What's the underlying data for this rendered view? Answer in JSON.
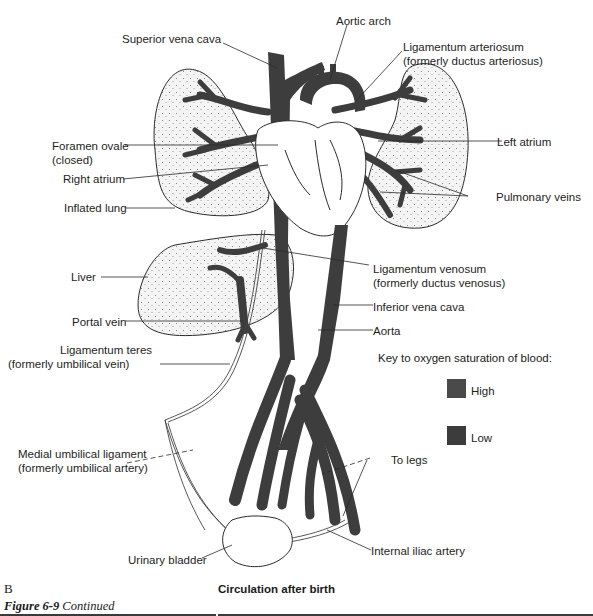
{
  "figure": {
    "panel_letter": "B",
    "title": "Circulation after birth",
    "caption_label": "Figure 6-9",
    "caption_text": "Continued"
  },
  "labels": {
    "superior_vena_cava": "Superior vena cava",
    "aortic_arch": "Aortic arch",
    "ligamentum_arteriosum_1": "Ligamentum arteriosum",
    "ligamentum_arteriosum_2": "(formerly ductus arteriosus)",
    "foramen_ovale_1": "Foramen ovale",
    "foramen_ovale_2": "(closed)",
    "right_atrium": "Right atrium",
    "inflated_lung": "Inflated lung",
    "left_atrium": "Left atrium",
    "pulmonary_veins": "Pulmonary veins",
    "liver": "Liver",
    "ligamentum_venosum_1": "Ligamentum venosum",
    "ligamentum_venosum_2": "(formerly ductus venosus)",
    "inferior_vena_cava": "Inferior vena cava",
    "aorta": "Aorta",
    "portal_vein": "Portal vein",
    "ligamentum_teres_1": "Ligamentum teres",
    "ligamentum_teres_2": "(formerly umbilical vein)",
    "medial_umbilical_1": "Medial umbilical ligament",
    "medial_umbilical_2": "(formerly umbilical artery)",
    "to_legs": "To legs",
    "urinary_bladder": "Urinary bladder",
    "internal_iliac_artery": "Internal iliac artery"
  },
  "key": {
    "title": "Key to oxygen saturation of blood:",
    "items": [
      {
        "label": "High",
        "color": "#4a4a4a"
      },
      {
        "label": "Low",
        "color": "#3c3c3c"
      }
    ]
  },
  "colors": {
    "vessel": "#3d3d3d",
    "outline": "#2a2a2a",
    "organ_fill": "#f4f4f4",
    "stipple": "#777777",
    "rule": "#3a3a3a"
  }
}
